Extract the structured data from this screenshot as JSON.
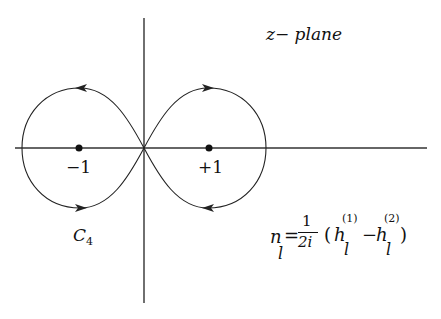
{
  "diagram": {
    "plane_label": "z− plane",
    "points": [
      {
        "label": "−1",
        "x": -1,
        "y": 0
      },
      {
        "label": "+1",
        "x": 1,
        "y": 0
      }
    ],
    "contour_label": {
      "main": "C",
      "subscript": "4"
    },
    "formula": {
      "lhs": "n",
      "lhs_sub": "l",
      "equals": "=",
      "frac_num": "1",
      "frac_den": "2i",
      "open_paren": "(",
      "h1": "h",
      "h1_sup": "(1)",
      "h1_sub": "l",
      "minus": "−",
      "h2": "h",
      "h2_sup": "(2)",
      "h2_sub": "l",
      "close_paren": ")"
    },
    "colors": {
      "stroke": "#222222",
      "background": "#ffffff"
    }
  }
}
